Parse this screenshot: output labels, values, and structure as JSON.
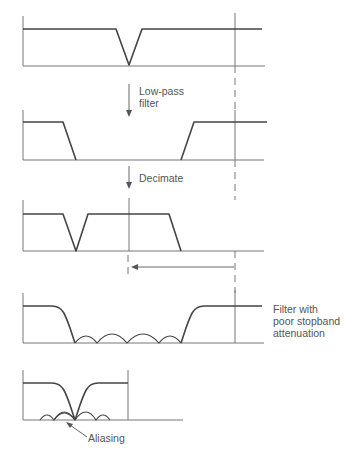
{
  "diagram": {
    "steps": [
      {
        "name": "input-spectrum"
      },
      {
        "name": "lowpass-filtered-spectrum",
        "arrow_label": "Low-pass\nfilter"
      },
      {
        "name": "decimated-spectrum",
        "arrow_label": "Decimate"
      },
      {
        "name": "poor-filter-spectrum",
        "note": "Filter with\npoor stopband\nattenuation"
      },
      {
        "name": "aliased-spectrum",
        "note": "Aliasing"
      }
    ],
    "labels": {
      "lowpass_line1": "Low-pass",
      "lowpass_line2": "filter",
      "decimate": "Decimate",
      "poor_line1": "Filter with",
      "poor_line2": "poor stopband",
      "poor_line3": "attenuation",
      "aliasing": "Aliasing"
    },
    "colors": {
      "line": "#444444",
      "axis": "#777777",
      "text": "#555555"
    }
  }
}
